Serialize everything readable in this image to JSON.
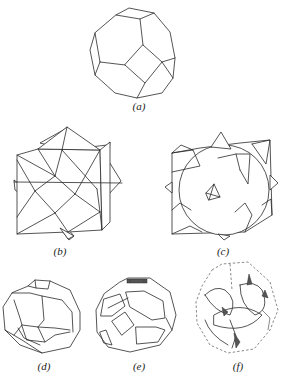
{
  "figure": {
    "panels": [
      {
        "id": "a",
        "label": "(a)",
        "description": "truncated octahedron"
      },
      {
        "id": "b",
        "label": "(b)",
        "description": "cube with pyramidal spikes"
      },
      {
        "id": "c",
        "label": "(c)",
        "description": "cube with spherical cavity and pyramidal spikes"
      },
      {
        "id": "d",
        "label": "(d)",
        "description": "hollow truncated octahedron frame"
      },
      {
        "id": "e",
        "label": "(e)",
        "description": "truncated octahedron with inset faces"
      },
      {
        "id": "f",
        "label": "(f)",
        "description": "curved-face cell in dashed truncated octahedron"
      }
    ]
  },
  "colors": {
    "line": "#2a2a2a",
    "background": "#ffffff"
  }
}
